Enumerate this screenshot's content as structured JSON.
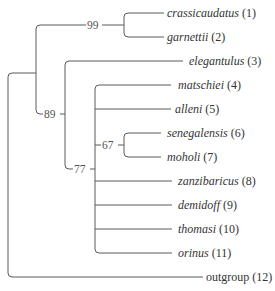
{
  "taxa": [
    {
      "name": "crassicaudatus",
      "num": "(1)"
    },
    {
      "name": "garnettii",
      "num": "(2)"
    },
    {
      "name": "elegantulus",
      "num": "(3)"
    },
    {
      "name": "matschiei",
      "num": "(4)"
    },
    {
      "name": "alleni",
      "num": "(5)"
    },
    {
      "name": "senegalensis",
      "num": "(6)"
    },
    {
      "name": "moholi",
      "num": "(7)"
    },
    {
      "name": "zanzibaricus",
      "num": "(8)"
    },
    {
      "name": "demidoff",
      "num": "(9)"
    },
    {
      "name": "thomasi",
      "num": "(10)"
    },
    {
      "name": "orinus",
      "num": "(11)"
    },
    {
      "name": "outgroup",
      "num": "(12)",
      "italic": false
    }
  ],
  "support_values": {
    "clade_1_2": "99",
    "clade_1_11": "89",
    "clade_4_11": "77",
    "clade_6_7": "67"
  },
  "colors": {
    "branch": "#5a5a5a",
    "text": "#333333"
  }
}
